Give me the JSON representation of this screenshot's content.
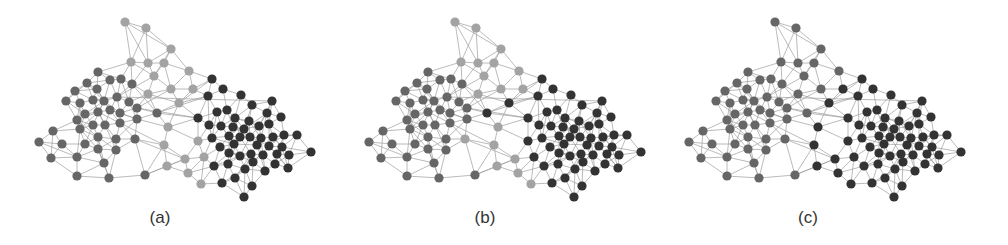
{
  "figure": {
    "panels": [
      {
        "id": "a",
        "caption": "(a)",
        "offset_x": 30,
        "caption_x": 130,
        "overrides": {}
      },
      {
        "id": "b",
        "caption": "(b)",
        "offset_x": 360,
        "caption_x": 455,
        "overrides": {
          "149,93": "D",
          "168,131": "D",
          "174,147": "D",
          "127,103": "D",
          "105,129": "L",
          "171,174": "L"
        }
      },
      {
        "id": "c",
        "caption": "(c)",
        "offset_x": 680,
        "caption_x": 778,
        "overrides": {
          "ALL_L": "M",
          "138,117": "D",
          "134,135": "D",
          "168,131": "D",
          "174,147": "D",
          "155,149": "D",
          "137,156": "D",
          "158,163": "D",
          "171,174": "D",
          "149,93": "D",
          "163,79": "D"
        }
      }
    ],
    "community_colors": {
      "L": "#a3a3a3",
      "M": "#666666",
      "D": "#333333"
    },
    "edge_color": "#9a9a9a",
    "node_radius": 4.6,
    "k_nearest": 4
  },
  "network": {
    "nodes": [
      [
        95,
        12,
        "L"
      ],
      [
        116,
        18,
        "L"
      ],
      [
        141,
        39,
        "L"
      ],
      [
        101,
        52,
        "L"
      ],
      [
        118,
        53,
        "L"
      ],
      [
        134,
        53,
        "L"
      ],
      [
        159,
        61,
        "L"
      ],
      [
        124,
        66,
        "L"
      ],
      [
        141,
        79,
        "L"
      ],
      [
        163,
        79,
        "L"
      ],
      [
        118,
        84,
        "L"
      ],
      [
        149,
        93,
        "L"
      ],
      [
        138,
        117,
        "L"
      ],
      [
        134,
        135,
        "L"
      ],
      [
        168,
        131,
        "L"
      ],
      [
        174,
        147,
        "L"
      ],
      [
        155,
        149,
        "L"
      ],
      [
        137,
        156,
        "L"
      ],
      [
        158,
        163,
        "L"
      ],
      [
        171,
        174,
        "L"
      ],
      [
        68,
        62,
        "M"
      ],
      [
        80,
        70,
        "M"
      ],
      [
        91,
        69,
        "M"
      ],
      [
        102,
        74,
        "M"
      ],
      [
        57,
        73,
        "M"
      ],
      [
        67,
        79,
        "M"
      ],
      [
        45,
        81,
        "M"
      ],
      [
        36,
        91,
        "M"
      ],
      [
        50,
        93,
        "M"
      ],
      [
        63,
        90,
        "M"
      ],
      [
        74,
        91,
        "M"
      ],
      [
        87,
        87,
        "M"
      ],
      [
        99,
        92,
        "M"
      ],
      [
        107,
        98,
        "M"
      ],
      [
        127,
        103,
        "M"
      ],
      [
        47,
        110,
        "M"
      ],
      [
        55,
        104,
        "M"
      ],
      [
        68,
        102,
        "M"
      ],
      [
        80,
        100,
        "M"
      ],
      [
        90,
        103,
        "M"
      ],
      [
        107,
        109,
        "M"
      ],
      [
        50,
        119,
        "M"
      ],
      [
        63,
        115,
        "M"
      ],
      [
        75,
        115,
        "M"
      ],
      [
        90,
        113,
        "M"
      ],
      [
        23,
        121,
        "M"
      ],
      [
        68,
        127,
        "M"
      ],
      [
        86,
        129,
        "M"
      ],
      [
        105,
        129,
        "M"
      ],
      [
        9,
        132,
        "M"
      ],
      [
        32,
        134,
        "M"
      ],
      [
        55,
        134,
        "M"
      ],
      [
        68,
        139,
        "M"
      ],
      [
        86,
        140,
        "M"
      ],
      [
        21,
        148,
        "M"
      ],
      [
        47,
        147,
        "M"
      ],
      [
        74,
        153,
        "M"
      ],
      [
        47,
        166,
        "M"
      ],
      [
        79,
        168,
        "M"
      ],
      [
        115,
        165,
        "M"
      ],
      [
        182,
        69,
        "D"
      ],
      [
        193,
        79,
        "D"
      ],
      [
        178,
        86,
        "D"
      ],
      [
        211,
        85,
        "D"
      ],
      [
        242,
        91,
        "D"
      ],
      [
        222,
        95,
        "D"
      ],
      [
        197,
        100,
        "D"
      ],
      [
        187,
        102,
        "D"
      ],
      [
        237,
        103,
        "D"
      ],
      [
        168,
        108,
        "D"
      ],
      [
        205,
        108,
        "D"
      ],
      [
        219,
        111,
        "D"
      ],
      [
        251,
        107,
        "D"
      ],
      [
        179,
        115,
        "D"
      ],
      [
        191,
        116,
        "D"
      ],
      [
        203,
        117,
        "D"
      ],
      [
        214,
        119,
        "D"
      ],
      [
        229,
        116,
        "D"
      ],
      [
        239,
        114,
        "D"
      ],
      [
        199,
        126,
        "D"
      ],
      [
        210,
        127,
        "D"
      ],
      [
        220,
        127,
        "D"
      ],
      [
        231,
        128,
        "D"
      ],
      [
        243,
        127,
        "D"
      ],
      [
        254,
        125,
        "D"
      ],
      [
        267,
        125,
        "D"
      ],
      [
        182,
        128,
        "D"
      ],
      [
        190,
        137,
        "D"
      ],
      [
        204,
        134,
        "D"
      ],
      [
        227,
        135,
        "D"
      ],
      [
        239,
        136,
        "D"
      ],
      [
        252,
        137,
        "D"
      ],
      [
        199,
        143,
        "D"
      ],
      [
        210,
        146,
        "D"
      ],
      [
        221,
        144,
        "D"
      ],
      [
        233,
        145,
        "D"
      ],
      [
        247,
        144,
        "D"
      ],
      [
        259,
        145,
        "D"
      ],
      [
        281,
        142,
        "D"
      ],
      [
        184,
        156,
        "D"
      ],
      [
        198,
        154,
        "D"
      ],
      [
        215,
        159,
        "D"
      ],
      [
        223,
        152,
        "D"
      ],
      [
        235,
        161,
        "D"
      ],
      [
        245,
        154,
        "D"
      ],
      [
        258,
        158,
        "D"
      ],
      [
        192,
        173,
        "D"
      ],
      [
        205,
        168,
        "D"
      ],
      [
        222,
        176,
        "D"
      ],
      [
        214,
        187,
        "D"
      ]
    ],
    "extra_edges": [
      [
        3,
        20
      ],
      [
        3,
        22
      ],
      [
        4,
        23
      ],
      [
        7,
        31
      ],
      [
        8,
        33
      ],
      [
        10,
        32
      ],
      [
        11,
        60
      ],
      [
        11,
        62
      ],
      [
        11,
        69
      ],
      [
        9,
        60
      ],
      [
        6,
        60
      ],
      [
        12,
        34
      ],
      [
        12,
        40
      ],
      [
        13,
        48
      ],
      [
        14,
        69
      ],
      [
        14,
        73
      ],
      [
        15,
        86
      ],
      [
        15,
        99
      ],
      [
        16,
        59
      ],
      [
        17,
        59
      ],
      [
        18,
        99
      ],
      [
        19,
        106
      ],
      [
        34,
        69
      ],
      [
        34,
        11
      ],
      [
        40,
        12
      ],
      [
        44,
        13
      ],
      [
        48,
        16
      ],
      [
        59,
        17
      ],
      [
        2,
        6
      ],
      [
        0,
        3
      ],
      [
        1,
        2
      ],
      [
        5,
        8
      ],
      [
        10,
        11
      ],
      [
        12,
        14
      ],
      [
        13,
        17
      ],
      [
        22,
        31
      ],
      [
        23,
        34
      ],
      [
        31,
        64
      ],
      [
        33,
        69
      ],
      [
        34,
        62
      ]
    ]
  }
}
